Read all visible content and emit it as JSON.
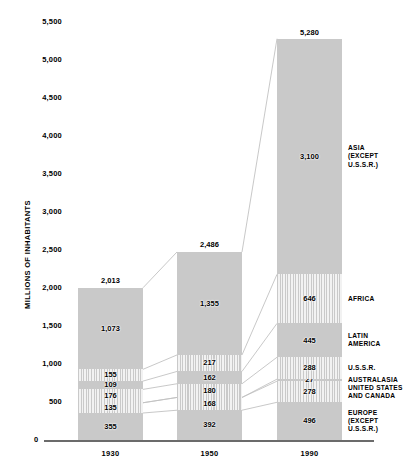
{
  "chart_data": {
    "type": "bar",
    "subtype": "stacked-bar-with-connectors",
    "title": "",
    "xlabel": "",
    "ylabel": "MILLIONS OF INHABITANTS",
    "ylim": [
      0,
      5500
    ],
    "ytick_step": 500,
    "ytick_labels": [
      "5,500",
      "5,000",
      "4,500",
      "4,000",
      "3,500",
      "3,000",
      "2,500",
      "2,000",
      "1,500",
      "1,000",
      "500",
      "0"
    ],
    "ytick_values": [
      5500,
      5000,
      4500,
      4000,
      3500,
      3000,
      2500,
      2000,
      1500,
      1000,
      500,
      0
    ],
    "grid": false,
    "legend_position": "right",
    "categories": [
      "1930",
      "1950",
      "1990"
    ],
    "category_totals": [
      2013,
      2486,
      5280
    ],
    "category_total_labels": [
      "2,013",
      "2,486",
      "5,280"
    ],
    "series_order_bottom_to_top": [
      "EUROPE\n(EXCEPT\nU.S.S.R.)",
      "UNITED STATES\nAND CANADA",
      "AUSTRALASIA",
      "U.S.S.R.",
      "LATIN\nAMERICA",
      "AFRICA",
      "ASIA\n(EXCEPT\nU.S.S.R.)"
    ],
    "series": [
      {
        "name": "EUROPE\n(EXCEPT\nU.S.S.R.)",
        "values": [
          355,
          392,
          496
        ],
        "labels": [
          "355",
          "392",
          "496"
        ],
        "fill": "solid"
      },
      {
        "name": "UNITED STATES\nAND CANADA",
        "values": [
          135,
          168,
          278
        ],
        "labels": [
          "135",
          "168",
          "278"
        ],
        "fill": "striped"
      },
      {
        "name": "AUSTRALASIA",
        "values": [
          0,
          0,
          27
        ],
        "labels": [
          "",
          "",
          "27"
        ],
        "fill": "solid"
      },
      {
        "name": "U.S.S.R.",
        "values": [
          176,
          180,
          288
        ],
        "labels": [
          "176",
          "180",
          "288"
        ],
        "fill": "striped"
      },
      {
        "name": "LATIN\nAMERICA",
        "values": [
          109,
          162,
          445
        ],
        "labels": [
          "109",
          "162",
          "445"
        ],
        "fill": "solid"
      },
      {
        "name": "AFRICA",
        "values": [
          155,
          217,
          646
        ],
        "labels": [
          "155",
          "217",
          "646"
        ],
        "fill": "striped"
      },
      {
        "name": "ASIA\n(EXCEPT\nU.S.S.R.)",
        "values": [
          1073,
          1355,
          3100
        ],
        "labels": [
          "1,073",
          "1,355",
          "3,100"
        ],
        "fill": "solid"
      }
    ],
    "colors": {
      "solid_fill": "#c9c9c9",
      "stripe_light": "#f2f2f2",
      "axis": "#6b6b6b",
      "text": "#000000"
    }
  },
  "legend_labels": [
    "ASIA\n(EXCEPT\nU.S.S.R.)",
    "AFRICA",
    "LATIN\nAMERICA",
    "U.S.S.R.",
    "AUSTRALASIA",
    "UNITED STATES\nAND CANADA",
    "EUROPE\n(EXCEPT\nU.S.S.R.)"
  ],
  "axis": {
    "zero_label": "0",
    "y_title": "MILLIONS OF INHABITANTS"
  }
}
